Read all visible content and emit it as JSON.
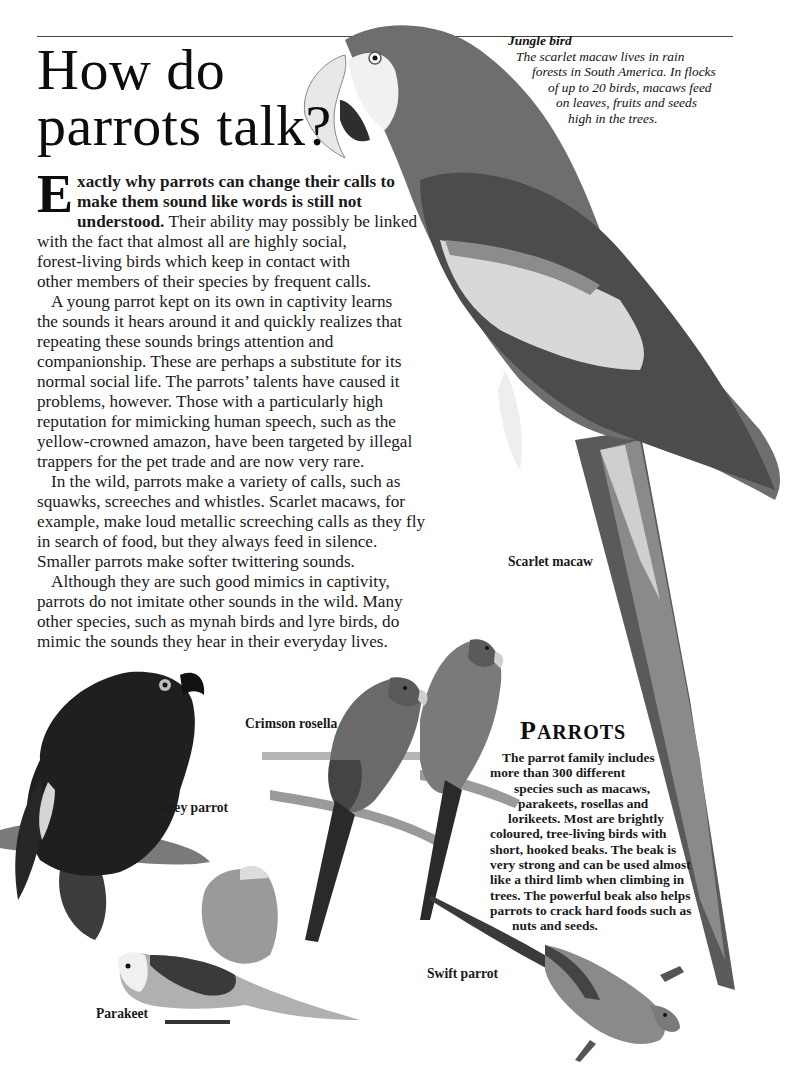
{
  "page": {
    "title_line1": "How do",
    "title_line2": "parrots talk?"
  },
  "caption": {
    "title": "Jungle bird",
    "lines": [
      "The scarlet macaw lives in rain",
      "forests in South America. In flocks",
      "of up to 20 birds, macaws feed",
      "on leaves, fruits and seeds",
      "high in the trees."
    ]
  },
  "body": {
    "dropcap": "E",
    "lead_line1": "xactly why parrots can change their calls to",
    "lead_line2": "make them sound like words is still not",
    "lead_line3": "understood.",
    "para1_rest": [
      " Their ability may possibly be linked",
      "with the fact that almost all are highly social,",
      "forest-living birds which keep in contact with",
      "other members of their species by frequent calls."
    ],
    "para2": [
      "A young parrot kept on its own in captivity learns",
      "the sounds it hears around it and quickly realizes that",
      "repeating these sounds brings attention and",
      "companionship. These are perhaps a substitute for its",
      "normal social life. The parrots’ talents have caused it",
      "problems, however. Those with a particularly high",
      "reputation for mimicking human speech, such as the",
      "yellow-crowned amazon, have been targeted by illegal",
      "trappers for the pet trade and are now very rare."
    ],
    "para3": [
      "In the wild, parrots make a variety of calls, such as",
      "squawks, screeches and whistles. Scarlet macaws, for",
      "example, make loud metallic screeching calls as they fly",
      "in search of food, but they always feed in silence.",
      "Smaller parrots make softer twittering sounds."
    ],
    "para4": [
      "Although they are such good mimics in captivity,",
      "parrots do not imitate other sounds in the wild. Many",
      "other species, such as mynah birds and lyre birds, do",
      "mimic the sounds they hear in their everyday lives."
    ]
  },
  "labels": {
    "scarlet_macaw": "Scarlet macaw",
    "crimson_rosella": "Crimson rosella",
    "grey_parrot": "Grey parrot",
    "parakeet": "Parakeet",
    "swift_parrot": "Swift parrot"
  },
  "info_box": {
    "title_initial": "P",
    "title_rest": "ARROTS",
    "lines": [
      "The parrot family includes",
      "more than 300 different",
      "species such as macaws,",
      "parakeets, rosellas and",
      "lorikeets. Most are brightly",
      "coloured, tree-living birds with",
      "short, hooked beaks. The beak is",
      "very strong and can be used almost",
      "like a third limb when climbing in",
      "trees. The powerful beak also helps",
      "parrots to crack hard foods such as",
      "nuts and seeds."
    ],
    "line_indents": [
      12,
      0,
      32,
      40,
      18,
      0,
      0,
      0,
      0,
      0,
      0,
      22
    ]
  },
  "colors": {
    "macaw_body": "#6e6e6e",
    "macaw_dark": "#4a4a4a",
    "wing_light": "#d8d8d8",
    "grey_parrot": "#1e1e1e",
    "text": "#1a1a1a"
  }
}
